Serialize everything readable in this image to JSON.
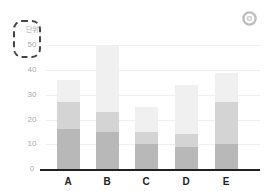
{
  "chart_data": {
    "type": "bar",
    "stacked": true,
    "title": "",
    "xlabel": "",
    "ylabel": "단위",
    "unit_label": "단위",
    "categories": [
      "A",
      "B",
      "C",
      "D",
      "E"
    ],
    "series": [
      {
        "name": "Series 1",
        "color": "#b8b8b8",
        "values": [
          16,
          15,
          10,
          9,
          10
        ]
      },
      {
        "name": "Series 2",
        "color": "#d4d4d4",
        "values": [
          11,
          8,
          5,
          5,
          17
        ]
      },
      {
        "name": "Series 3",
        "color": "#f0f0f0",
        "values": [
          9,
          27,
          10,
          20,
          12
        ]
      }
    ],
    "totals": [
      36,
      50,
      25,
      34,
      39
    ],
    "ylim": [
      0,
      50
    ],
    "yticks": [
      0,
      10,
      20,
      30,
      40,
      50
    ],
    "grid": true,
    "legend": "none"
  },
  "axis": {
    "unit_label": "단위",
    "yticks": [
      "0",
      "10",
      "20",
      "30",
      "40",
      "50"
    ],
    "xticks": [
      "A",
      "B",
      "C",
      "D",
      "E"
    ]
  },
  "icons": {
    "top_right": "ring-icon"
  }
}
